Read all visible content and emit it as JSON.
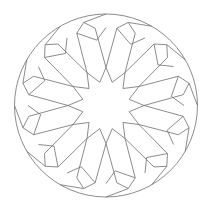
{
  "diagram": {
    "symmetry": 12,
    "center": [
      106,
      105.5
    ],
    "circle_radius": 91.5,
    "stroke_color": "#6e6e6e",
    "background": "#ffffff",
    "petal_polar": [
      [
        14,
        0
      ],
      [
        26,
        15
      ],
      [
        70,
        6
      ],
      [
        91.5,
        0
      ],
      [
        70,
        -6
      ],
      [
        26,
        -15
      ]
    ],
    "outer_link_polar": [
      [
        70,
        6
      ],
      [
        84,
        20
      ],
      [
        70,
        24
      ]
    ]
  }
}
